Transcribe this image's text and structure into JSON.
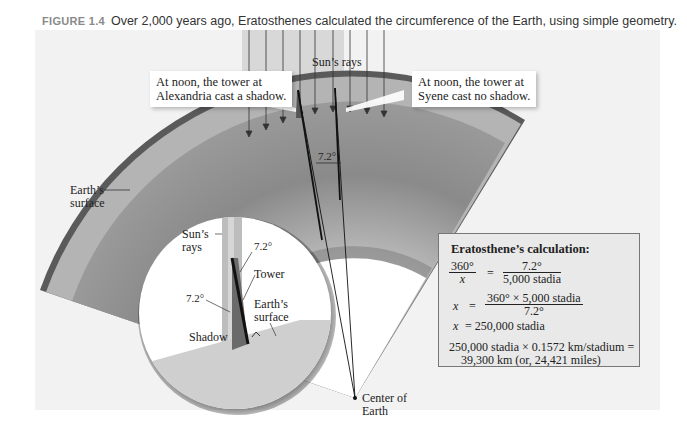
{
  "caption": {
    "figure_label": "FIGURE 1.4",
    "text": "Over 2,000 years ago, Eratosthenes calculated the circumference of the Earth, using simple geometry."
  },
  "labels": {
    "suns_rays_top": "Sun’s rays",
    "alexandria_line1": "At noon, the tower at",
    "alexandria_line2": "Alexandria cast a shadow.",
    "syene_line1": "At noon, the tower at",
    "syene_line2": "Syene cast no shadow.",
    "angle_center": "7.2°",
    "earth_surface_line1": "Earth’s",
    "earth_surface_line2": "surface",
    "center_line1": "Center of",
    "center_line2": "Earth"
  },
  "inset": {
    "suns_rays_line1": "Sun’s",
    "suns_rays_line2": "rays",
    "angle_top": "7.2°",
    "tower": "Tower",
    "angle_left": "7.2°",
    "earth_surface_line1": "Earth’s",
    "earth_surface_line2": "surface",
    "shadow": "Shadow"
  },
  "calculation": {
    "title": "Eratosthene’s calculation:",
    "eq1_left_num": "360°",
    "eq1_left_den": "x",
    "eq1_equals": "=",
    "eq1_right_num": "7.2°",
    "eq1_right_den": "5,000 stadia",
    "eq2_var": "x",
    "eq2_equals": "=",
    "eq2_num": "360° × 5,000 stadia",
    "eq2_den": "7.2°",
    "eq3_var": "x",
    "eq3_rest": "= 250,000 stadia",
    "result_line1": "250,000 stadia × 0.1572 km/stadium =",
    "result_line2": "39,300 km (or, 24,421 miles)"
  },
  "colors": {
    "panel_bg": "#f2f2f2",
    "surface_dark": "#555555",
    "crust": "#b4b4b4",
    "mantle": "#8c8c8c",
    "rays_bg": "#d8d8d8",
    "core": "#ffffff"
  }
}
